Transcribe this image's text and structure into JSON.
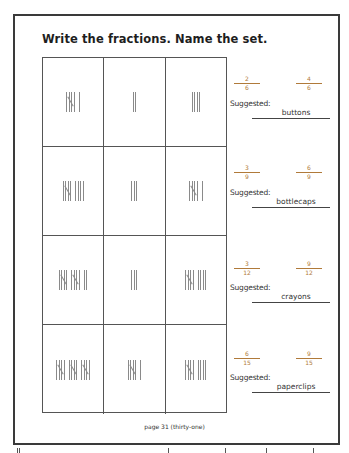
{
  "title": "Write the fractions. Name the set.",
  "colors": {
    "fraction_text": "#b07a3a",
    "border": "#3a3a3a",
    "tally": "#8a8a8a"
  },
  "rows": [
    {
      "tallies": [
        6,
        2,
        4
      ],
      "fractions": [
        {
          "numerator": "2",
          "denominator": "6"
        },
        {
          "numerator": "4",
          "denominator": "6"
        }
      ],
      "suggested_label": "Suggested:",
      "set_name": "buttons"
    },
    {
      "tallies": [
        9,
        3,
        6
      ],
      "fractions": [
        {
          "numerator": "3",
          "denominator": "9"
        },
        {
          "numerator": "6",
          "denominator": "9"
        }
      ],
      "suggested_label": "Suggested:",
      "set_name": "bottlecaps"
    },
    {
      "tallies": [
        12,
        3,
        9
      ],
      "fractions": [
        {
          "numerator": "3",
          "denominator": "12"
        },
        {
          "numerator": "9",
          "denominator": "12"
        }
      ],
      "suggested_label": "Suggested:",
      "set_name": "crayons"
    },
    {
      "tallies": [
        15,
        6,
        9
      ],
      "fractions": [
        {
          "numerator": "6",
          "denominator": "15"
        },
        {
          "numerator": "9",
          "denominator": "15"
        }
      ],
      "suggested_label": "Suggested:",
      "set_name": "paperclips"
    }
  ],
  "footer": "page 31 (thirty-one)"
}
